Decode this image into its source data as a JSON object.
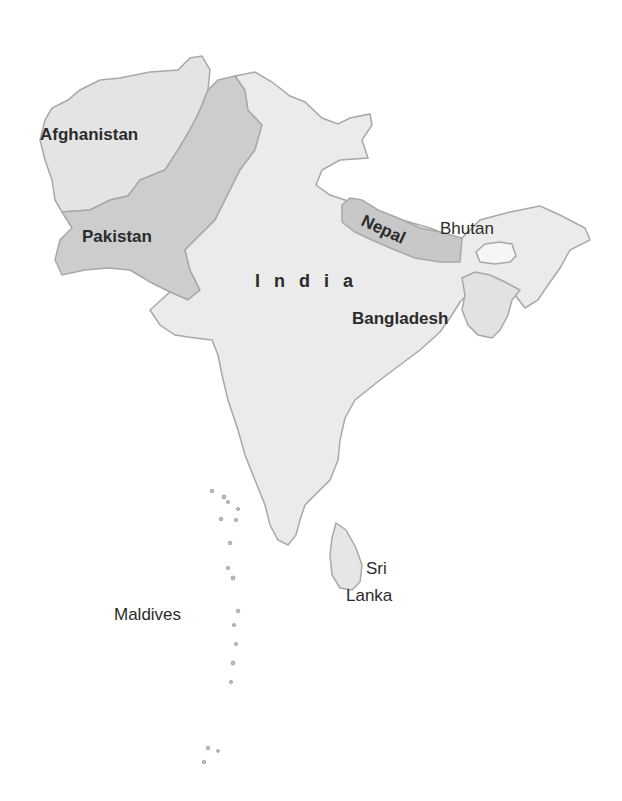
{
  "map": {
    "region": "South Asia",
    "colors": {
      "background": "#ffffff",
      "afghanistan": "#e4e4e4",
      "pakistan": "#cdcdcd",
      "india": "#ebebeb",
      "nepal": "#c8c8c8",
      "bhutan": "#f6f6f6",
      "bangladesh": "#e2e2e2",
      "sri_lanka": "#e6e6e6",
      "maldives": "#bdbdbd",
      "border": "#a8a8a8",
      "label": "#2b2b2b"
    },
    "labels": {
      "afghanistan": "Afghanistan",
      "pakistan": "Pakistan",
      "india": "India",
      "nepal": "Nepal",
      "bhutan": "Bhutan",
      "bangladesh": "Bangladesh",
      "sri": "Sri",
      "lanka": "Lanka",
      "maldives": "Maldives"
    }
  }
}
